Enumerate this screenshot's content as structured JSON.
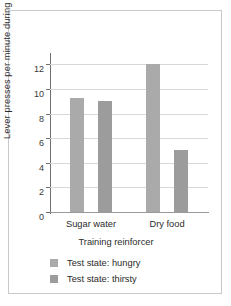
{
  "chart_data": {
    "type": "bar",
    "title": "",
    "xlabel": "Training reinforcer",
    "ylabel": "Lever presses per minute during extinction",
    "categories": [
      "Sugar water",
      "Dry food"
    ],
    "series": [
      {
        "name": "Test state: hungry",
        "color": "#aaaaaa",
        "values": [
          9.3,
          12.0
        ]
      },
      {
        "name": "Test state: thirsty",
        "color": "#9c9c9c",
        "values": [
          9.0,
          5.0
        ]
      }
    ],
    "ylim": [
      0,
      13
    ],
    "yticks": [
      0,
      2,
      4,
      6,
      8,
      10,
      12
    ],
    "ytick_labels": [
      "0",
      "2",
      "4",
      "6",
      "8",
      "10",
      "12"
    ],
    "grid": true,
    "legend_position": "below"
  },
  "figure": {
    "border_color": "#c9c9c9",
    "background": "#ffffff"
  }
}
